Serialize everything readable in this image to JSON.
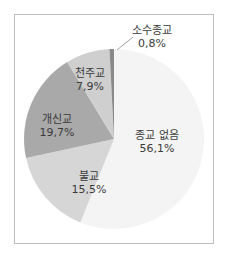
{
  "chart_data": {
    "type": "pie",
    "title": "",
    "decimal_separator": ",",
    "start_angle": "12 o'clock, clockwise",
    "slices": [
      {
        "label": "종교 없음",
        "value": 56.1,
        "value_text": "56,1%",
        "color": "#f4f4f4"
      },
      {
        "label": "불교",
        "value": 15.5,
        "value_text": "15,5%",
        "color": "#d6d6d6"
      },
      {
        "label": "개신교",
        "value": 19.7,
        "value_text": "19,7%",
        "color": "#a9a9a9"
      },
      {
        "label": "천주교",
        "value": 7.9,
        "value_text": "7,9%",
        "color": "#cfcfcf"
      },
      {
        "label": "소수종교",
        "value": 0.8,
        "value_text": "0,8%",
        "color": "#8a8a8a"
      }
    ],
    "legend": "none (direct labels on slices)",
    "annotations": [
      {
        "target": "소수종교",
        "type": "leader-line",
        "label_outside": true
      }
    ]
  },
  "labels": {
    "none": {
      "name": "종교 없음",
      "pct": "56,1%"
    },
    "buddhism": {
      "name": "불교",
      "pct": "15,5%"
    },
    "protestant": {
      "name": "개신교",
      "pct": "19,7%"
    },
    "catholic": {
      "name": "천주교",
      "pct": "7,9%"
    },
    "minor": {
      "name": "소수종교",
      "pct": "0,8%"
    }
  }
}
